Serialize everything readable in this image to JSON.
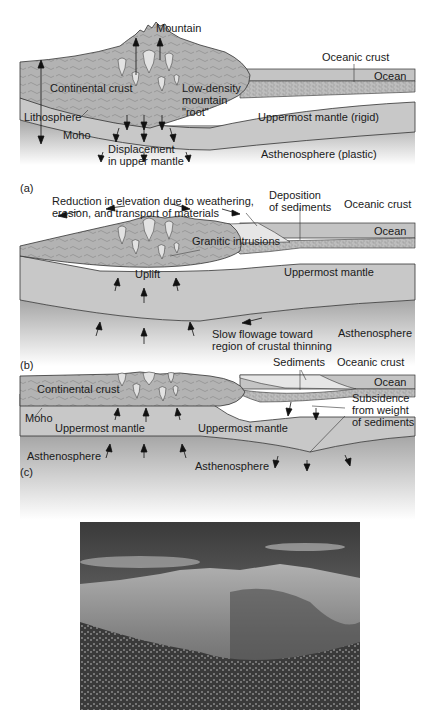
{
  "figure": {
    "panels": [
      {
        "id": "a",
        "label": "(a)",
        "annotations": {
          "mountain": "Mountain",
          "oceanic_crust": "Oceanic crust",
          "ocean": "Ocean",
          "continental_crust": "Continental crust",
          "low_density_root": "Low-density\nmountain\n\"root\"",
          "lithosphere": "Lithosphere",
          "moho": "Moho",
          "uppermost_mantle": "Uppermost mantle (rigid)",
          "displacement": "Displacement\nin upper mantle",
          "asthenosphere": "Asthenosphere (plastic)"
        }
      },
      {
        "id": "b",
        "label": "(b)",
        "annotations": {
          "reduction": "Reduction in elevation due to weathering,\nerosion, and transport of materials",
          "deposition": "Deposition\nof sediments",
          "oceanic_crust": "Oceanic crust",
          "ocean": "Ocean",
          "granitic_intrusions": "Granitic intrusions",
          "uplift": "Uplift",
          "uppermost_mantle": "Uppermost mantle",
          "slow_flowage": "Slow flowage toward\nregion of crustal thinning",
          "asthenosphere": "Asthenosphere"
        }
      },
      {
        "id": "c",
        "label": "(c)",
        "annotations": {
          "sediments": "Sediments",
          "oceanic_crust": "Oceanic crust",
          "ocean": "Ocean",
          "continental_crust": "Continental crust",
          "moho": "Moho",
          "uppermost_mantle_left": "Uppermost mantle",
          "uppermost_mantle_right": "Uppermost mantle",
          "subsidence": "Subsidence\nfrom weight\nof sediments",
          "asthenosphere_left": "Asthenosphere",
          "asthenosphere_right": "Asthenosphere"
        }
      }
    ],
    "photo": {
      "subject": "mountain-range-photograph"
    },
    "colors": {
      "crust": "#b8b8b8",
      "mantle": "#c9c9c9",
      "asthenosphere": "#a9a9a9",
      "ocean": "#c2c2c2",
      "sediment": "#e4e4e4",
      "line": "#333333"
    }
  }
}
